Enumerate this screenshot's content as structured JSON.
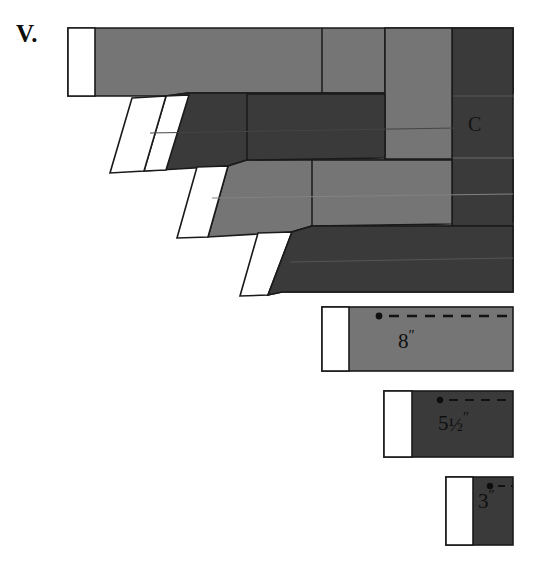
{
  "figure": {
    "plate_number": "V.",
    "label_c": "C",
    "background_color": "#ffffff",
    "outline_color": "#1a1a1a",
    "gray_medium": "#757575",
    "gray_dark": "#3a3a3a",
    "white_tip_color": "#ffffff",
    "dash_color": "#1a1a1a"
  },
  "assembly": {
    "name": "stacked-interlocking-boards",
    "description": "Four overlapping board courses forming a stepped corner assembly with white end tips",
    "courses": [
      {
        "index": 1,
        "name": "top-course",
        "shade": "gray_medium",
        "tip": "white-square-tip",
        "top": 28,
        "bottom": 93
      },
      {
        "index": 2,
        "name": "second-course",
        "shade": "gray_dark",
        "tip": "white-slanted-tip",
        "top": 93,
        "bottom": 162
      },
      {
        "index": 3,
        "name": "third-course",
        "shade": "gray_medium",
        "tip": "white-slanted-tip",
        "top": 162,
        "bottom": 228
      },
      {
        "index": 4,
        "name": "fourth-course",
        "shade": "gray_dark",
        "tip": "white-slanted-tip",
        "top": 228,
        "bottom": 295
      }
    ]
  },
  "dimension_bars": [
    {
      "name": "bar-8-inch",
      "value": "8",
      "inch_mark": "″",
      "shade": "gray_medium",
      "x": 322,
      "y": 307,
      "width": 191,
      "height": 64,
      "tip_width": 27,
      "dot_x": 379,
      "dash_y": 316
    },
    {
      "name": "bar-5-and-a-half-inch",
      "value": "5",
      "fraction": "½",
      "inch_mark": "″",
      "shade": "gray_dark",
      "x": 384,
      "y": 391,
      "width": 129,
      "height": 66,
      "tip_width": 28,
      "dot_x": 440,
      "dash_y": 400
    },
    {
      "name": "bar-3-inch",
      "value": "3",
      "inch_mark": "″",
      "shade": "gray_dark",
      "x": 446,
      "y": 477,
      "width": 67,
      "height": 68,
      "tip_width": 27,
      "dot_x": 490,
      "dash_y": 486
    }
  ],
  "dimensions": {
    "label_8": "8",
    "label_5_whole": "5",
    "label_5_fraction": "½",
    "label_3": "3",
    "inch_symbol": "″"
  },
  "canvas": {
    "width": 535,
    "height": 562
  }
}
